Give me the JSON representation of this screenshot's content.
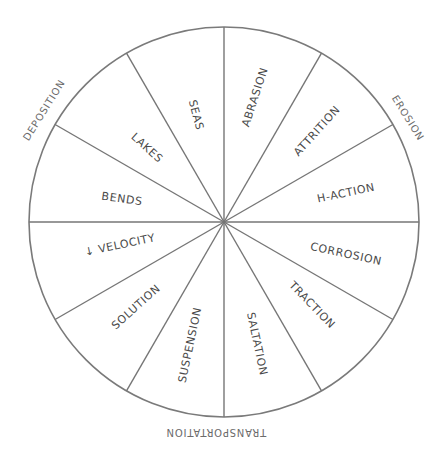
{
  "diagram": {
    "type": "segmented-wheel",
    "center": [
      224,
      222
    ],
    "radius": 195,
    "colors": {
      "stroke": "#767676",
      "text": "#4a4a4a",
      "group_text": "#6b6b6b",
      "background": "#ffffff"
    },
    "spoke_angles_deg": [
      0,
      30,
      60,
      90,
      120,
      150,
      180,
      210,
      240,
      270,
      300,
      330
    ],
    "segments": [
      {
        "label": "SEAS",
        "x": 196,
        "y": 115,
        "rotate": 75
      },
      {
        "label": "ABRASION",
        "x": 255,
        "y": 97,
        "rotate": -72
      },
      {
        "label": "ATTRITION",
        "x": 317,
        "y": 131,
        "rotate": -48
      },
      {
        "label": "H-ACTION",
        "x": 346,
        "y": 193,
        "rotate": -12
      },
      {
        "label": "CORROSION",
        "x": 346,
        "y": 254,
        "rotate": 12
      },
      {
        "label": "TRACTION",
        "x": 312,
        "y": 305,
        "rotate": 46
      },
      {
        "label": "SALTATION",
        "x": 257,
        "y": 344,
        "rotate": 78
      },
      {
        "label": "SUSPENSION",
        "x": 190,
        "y": 345,
        "rotate": -78
      },
      {
        "label": "SOLUTION",
        "x": 136,
        "y": 307,
        "rotate": -42
      },
      {
        "label": "↓ VELOCITY",
        "x": 120,
        "y": 245,
        "rotate": -12
      },
      {
        "label": "BENDS",
        "x": 122,
        "y": 199,
        "rotate": 8
      },
      {
        "label": "LAKES",
        "x": 147,
        "y": 148,
        "rotate": 42
      }
    ],
    "groups": [
      {
        "label": "DEPOSITION",
        "x": 44,
        "y": 110,
        "rotate": -58
      },
      {
        "label": "EROSION",
        "x": 408,
        "y": 118,
        "rotate": 58
      },
      {
        "label": "TRANSPORTATION",
        "x": 216,
        "y": 432,
        "rotate": 180
      }
    ]
  }
}
